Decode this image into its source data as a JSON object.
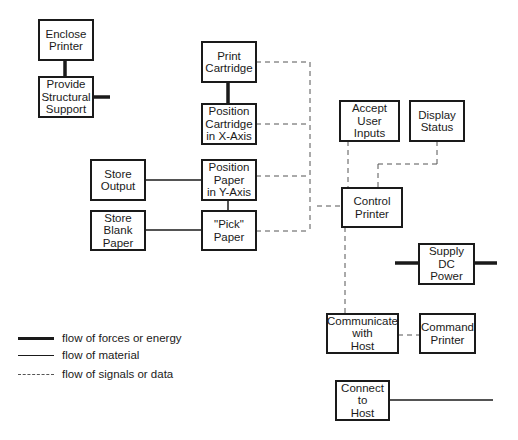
{
  "diagram": {
    "type": "function-structure",
    "boxes": {
      "enclose_printer": "Enclose\nPrinter",
      "provide_support": "Provide\nStructural\nSupport",
      "print_cartridge": "Print\nCartridge",
      "position_cartridge": "Position\nCartridge\nin X-Axis",
      "store_output": "Store\nOutput",
      "position_paper": "Position\nPaper\nin Y-Axis",
      "store_blank": "Store\nBlank\nPaper",
      "pick_paper": "\"Pick\"\nPaper",
      "accept_inputs": "Accept\nUser\nInputs",
      "display_status": "Display\nStatus",
      "control_printer": "Control\nPrinter",
      "supply_power": "Supply\nDC\nPower",
      "communicate_host": "Communicate\nwith\nHost",
      "command_printer": "Command\nPrinter",
      "connect_host": "Connect\nto\nHost"
    },
    "legend": {
      "energy": "flow of forces or energy",
      "material": "flow of material",
      "signal": "flow of signals or data"
    },
    "colors": {
      "line": "#1a1a1a",
      "background": "#ffffff"
    }
  }
}
